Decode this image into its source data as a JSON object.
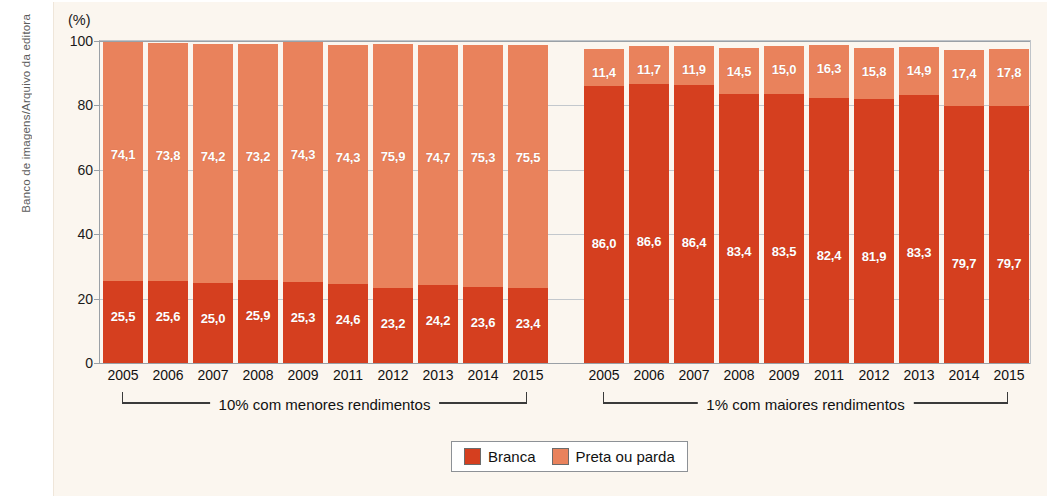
{
  "credit": "Banco de imagens/Arquivo da editora",
  "axis": {
    "unit_label": "(%)",
    "yticks": [
      0,
      20,
      40,
      60,
      80,
      100
    ],
    "ylim": [
      0,
      100
    ]
  },
  "legend": {
    "items": [
      {
        "label": "Branca",
        "color": "#d53f1f"
      },
      {
        "label": "Preta ou parda",
        "color": "#e9825c"
      }
    ]
  },
  "groups": [
    {
      "caption": "10% com menores rendimentos",
      "categories": [
        "2005",
        "2006",
        "2007",
        "2008",
        "2009",
        "2011",
        "2012",
        "2013",
        "2014",
        "2015"
      ],
      "branca": [
        25.5,
        25.6,
        25.0,
        25.9,
        25.3,
        24.6,
        23.2,
        24.2,
        23.6,
        23.4
      ],
      "preta_ou_parda": [
        74.1,
        73.8,
        74.2,
        73.2,
        74.3,
        74.3,
        75.9,
        74.7,
        75.3,
        75.5
      ],
      "branca_labels": [
        "25,5",
        "25,6",
        "25,0",
        "25,9",
        "25,3",
        "24,6",
        "23,2",
        "24,2",
        "23,6",
        "23,4"
      ],
      "preta_ou_parda_labels": [
        "74,1",
        "73,8",
        "74,2",
        "73,2",
        "74,3",
        "74,3",
        "75,9",
        "74,7",
        "75,3",
        "75,5"
      ]
    },
    {
      "caption": "1% com maiores rendimentos",
      "categories": [
        "2005",
        "2006",
        "2007",
        "2008",
        "2009",
        "2011",
        "2012",
        "2013",
        "2014",
        "2015"
      ],
      "branca": [
        86.0,
        86.6,
        86.4,
        83.4,
        83.5,
        82.4,
        81.9,
        83.3,
        79.7,
        79.7
      ],
      "preta_ou_parda": [
        11.4,
        11.7,
        11.9,
        14.5,
        15.0,
        16.3,
        15.8,
        14.9,
        17.4,
        17.8
      ],
      "branca_labels": [
        "86,0",
        "86,6",
        "86,4",
        "83,4",
        "83,5",
        "82,4",
        "81,9",
        "83,3",
        "79,7",
        "79,7"
      ],
      "preta_ou_parda_labels": [
        "11,4",
        "11,7",
        "11,9",
        "14,5",
        "15,0",
        "16,3",
        "15,8",
        "14,9",
        "17,4",
        "17,8"
      ]
    }
  ],
  "chart_data": {
    "type": "bar",
    "title": "",
    "subtitle": "",
    "xlabel": "",
    "ylabel": "(%)",
    "ylim": [
      0,
      100
    ],
    "yticks": [
      0,
      20,
      40,
      60,
      80,
      100
    ],
    "grid": true,
    "stacked": true,
    "legend_position": "bottom-center",
    "legend_entries": [
      "Branca",
      "Preta ou parda"
    ],
    "panels": [
      {
        "name": "10% com menores rendimentos",
        "categories": [
          "2005",
          "2006",
          "2007",
          "2008",
          "2009",
          "2011",
          "2012",
          "2013",
          "2014",
          "2015"
        ],
        "series": [
          {
            "name": "Branca",
            "color": "#d53f1f",
            "values": [
              25.5,
              25.6,
              25.0,
              25.9,
              25.3,
              24.6,
              23.2,
              24.2,
              23.6,
              23.4
            ]
          },
          {
            "name": "Preta ou parda",
            "color": "#e9825c",
            "values": [
              74.1,
              73.8,
              74.2,
              73.2,
              74.3,
              74.3,
              75.9,
              74.7,
              75.3,
              75.5
            ]
          }
        ]
      },
      {
        "name": "1% com maiores rendimentos",
        "categories": [
          "2005",
          "2006",
          "2007",
          "2008",
          "2009",
          "2011",
          "2012",
          "2013",
          "2014",
          "2015"
        ],
        "series": [
          {
            "name": "Branca",
            "color": "#d53f1f",
            "values": [
              86.0,
              86.6,
              86.4,
              83.4,
              83.5,
              82.4,
              81.9,
              83.3,
              79.7,
              79.7
            ]
          },
          {
            "name": "Preta ou parda",
            "color": "#e9825c",
            "values": [
              11.4,
              11.7,
              11.9,
              14.5,
              15.0,
              16.3,
              15.8,
              14.9,
              17.4,
              17.8
            ]
          }
        ]
      }
    ]
  }
}
